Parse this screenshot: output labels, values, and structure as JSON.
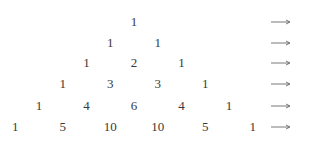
{
  "triangle": {
    "rows": [
      [
        1
      ],
      [
        1,
        1
      ],
      [
        1,
        2,
        1
      ],
      [
        1,
        3,
        3,
        1
      ],
      [
        1,
        4,
        6,
        4,
        1
      ],
      [
        1,
        5,
        10,
        10,
        5,
        1
      ]
    ],
    "row_suffix_icon": "long-right-arrow-icon"
  }
}
